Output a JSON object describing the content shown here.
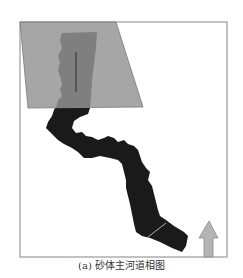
{
  "figure": {
    "caption": "(a) 砂体主河道相图",
    "colors": {
      "frame": "#9a9a9a",
      "overlay_fill": "#9e9e9e",
      "overlay_stroke": "#7a7a7a",
      "inner_region": "#7f7f7f",
      "well_line": "#3a3a3a",
      "channel_fill": "#1a1a1a",
      "arrow_fill": "#b4b4b4",
      "arrow_stroke": "#8a8a8a",
      "background": "#ffffff"
    },
    "elements": {
      "frame_label": "map-frame",
      "overlay_label": "gray-parallelogram-overlay",
      "channel_label": "main-channel-sand-body",
      "north_arrow_label": "north-arrow"
    }
  }
}
